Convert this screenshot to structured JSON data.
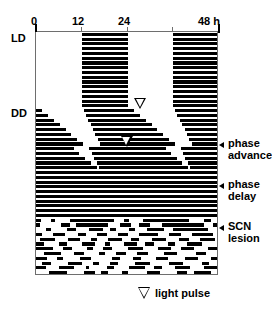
{
  "figure": {
    "type": "actogram",
    "title": "",
    "background_color": "#ffffff",
    "bar_color": "#000000",
    "axis_color": "#6e6e6e"
  },
  "axis": {
    "unit_label": "48 h",
    "ticks": [
      {
        "value": 0,
        "label": "0"
      },
      {
        "value": 12,
        "label": "12"
      },
      {
        "value": 24,
        "label": "24"
      },
      {
        "value": 36,
        "label": ""
      },
      {
        "value": 48,
        "label": "48 h"
      }
    ],
    "range": [
      0,
      48
    ]
  },
  "side_labels": [
    {
      "name": "ld",
      "label": "LD"
    },
    {
      "name": "dd",
      "label": "DD"
    }
  ],
  "annotations": [
    {
      "name": "phase-advance",
      "line1": "phase",
      "line2": "advance"
    },
    {
      "name": "phase-delay",
      "line1": "phase",
      "line2": "delay"
    },
    {
      "name": "scn-lesion",
      "line1": "SCN",
      "line2": "lesion"
    }
  ],
  "legend": {
    "symbol": "light-pulse-triangle",
    "label": "light pulse"
  },
  "light_pulses": [
    {
      "name": "light-pulse-advance",
      "hour": 27.6,
      "day": 17
    },
    {
      "name": "light-pulse-delay",
      "hour": 24.0,
      "day": 25
    }
  ],
  "chart_data": {
    "type": "bar",
    "xlabel": "Time (h)",
    "ylabel": "Successive days",
    "xlim": [
      0,
      48
    ],
    "grid": false,
    "legend_position": "bottom",
    "phases": [
      {
        "name": "LD",
        "days": [
          1,
          16
        ],
        "note": "entrained to light-dark cycle"
      },
      {
        "name": "DD",
        "days": [
          17,
          39
        ],
        "note": "constant darkness, free-running"
      },
      {
        "name": "SCN lesion",
        "days": [
          40,
          51
        ],
        "note": "arrhythmic"
      }
    ],
    "rows": [
      {
        "day": 1,
        "bars": [
          [
            12.0,
            24.0
          ],
          [
            36.0,
            48.0
          ]
        ]
      },
      {
        "day": 2,
        "bars": [
          [
            12.0,
            24.0
          ],
          [
            36.0,
            48.0
          ]
        ]
      },
      {
        "day": 3,
        "bars": [
          [
            12.0,
            24.0
          ],
          [
            36.0,
            48.0
          ]
        ]
      },
      {
        "day": 4,
        "bars": [
          [
            12.0,
            24.0
          ],
          [
            36.0,
            48.0
          ]
        ]
      },
      {
        "day": 5,
        "bars": [
          [
            12.0,
            24.0
          ],
          [
            36.0,
            48.0
          ]
        ]
      },
      {
        "day": 6,
        "bars": [
          [
            12.0,
            24.0
          ],
          [
            36.0,
            48.0
          ]
        ]
      },
      {
        "day": 7,
        "bars": [
          [
            12.0,
            24.0
          ],
          [
            36.0,
            48.0
          ]
        ]
      },
      {
        "day": 8,
        "bars": [
          [
            12.0,
            24.0
          ],
          [
            36.0,
            48.0
          ]
        ]
      },
      {
        "day": 9,
        "bars": [
          [
            12.0,
            24.0
          ],
          [
            36.0,
            48.0
          ]
        ]
      },
      {
        "day": 10,
        "bars": [
          [
            12.0,
            24.0
          ],
          [
            36.0,
            48.0
          ]
        ]
      },
      {
        "day": 11,
        "bars": [
          [
            12.0,
            24.0
          ],
          [
            36.0,
            48.0
          ]
        ]
      },
      {
        "day": 12,
        "bars": [
          [
            12.0,
            24.0
          ],
          [
            36.0,
            48.0
          ]
        ]
      },
      {
        "day": 13,
        "bars": [
          [
            12.0,
            24.0
          ],
          [
            36.0,
            48.0
          ]
        ]
      },
      {
        "day": 14,
        "bars": [
          [
            12.0,
            24.0
          ],
          [
            36.0,
            48.0
          ]
        ]
      },
      {
        "day": 15,
        "bars": [
          [
            12.0,
            24.0
          ],
          [
            36.0,
            48.0
          ]
        ]
      },
      {
        "day": 16,
        "bars": [
          [
            12.0,
            24.0
          ],
          [
            36.0,
            48.0
          ]
        ]
      },
      {
        "day": 17,
        "bars": [
          [
            0.0,
            1.6
          ],
          [
            12.5,
            25.6
          ],
          [
            36.5,
            48.0
          ]
        ]
      },
      {
        "day": 18,
        "bars": [
          [
            0.0,
            3.2
          ],
          [
            13.0,
            27.2
          ],
          [
            37.0,
            48.0
          ]
        ]
      },
      {
        "day": 19,
        "bars": [
          [
            0.0,
            4.8
          ],
          [
            13.7,
            28.8
          ],
          [
            37.7,
            48.0
          ]
        ]
      },
      {
        "day": 20,
        "bars": [
          [
            0.0,
            6.3
          ],
          [
            14.3,
            30.3
          ],
          [
            38.3,
            48.0
          ]
        ]
      },
      {
        "day": 21,
        "bars": [
          [
            0.0,
            7.8
          ],
          [
            15.0,
            31.8
          ],
          [
            39.0,
            48.0
          ]
        ]
      },
      {
        "day": 22,
        "bars": [
          [
            0.0,
            9.3
          ],
          [
            15.6,
            33.3
          ],
          [
            39.6,
            48.0
          ]
        ]
      },
      {
        "day": 23,
        "bars": [
          [
            0.0,
            10.8
          ],
          [
            16.2,
            34.8
          ],
          [
            40.2,
            48.0
          ]
        ]
      },
      {
        "day": 24,
        "bars": [
          [
            0.0,
            12.4
          ],
          [
            16.9,
            36.4
          ],
          [
            40.9,
            48.0
          ]
        ]
      },
      {
        "day": 25,
        "bars": [
          [
            0.0,
            10.0
          ],
          [
            14.0,
            34.0
          ],
          [
            38.0,
            48.0
          ]
        ]
      },
      {
        "day": 26,
        "bars": [
          [
            0.0,
            11.4
          ],
          [
            14.6,
            35.4
          ],
          [
            38.6,
            48.0
          ]
        ]
      },
      {
        "day": 27,
        "bars": [
          [
            0.0,
            12.9
          ],
          [
            15.2,
            36.9
          ],
          [
            39.2,
            48.0
          ]
        ]
      },
      {
        "day": 28,
        "bars": [
          [
            0.0,
            14.4
          ],
          [
            15.9,
            38.4
          ],
          [
            39.9,
            48.0
          ]
        ]
      },
      {
        "day": 29,
        "bars": [
          [
            0.0,
            15.9
          ],
          [
            16.5,
            39.9
          ],
          [
            40.5,
            48.0
          ]
        ]
      },
      {
        "day": 30,
        "bars": [
          [
            0.0,
            17.4
          ],
          [
            17.2,
            41.4
          ],
          [
            41.2,
            48.0
          ]
        ]
      },
      {
        "day": 31,
        "bars": [
          [
            0.0,
            19.0
          ],
          [
            17.8,
            43.0
          ],
          [
            41.8,
            48.0
          ]
        ]
      },
      {
        "day": 32,
        "bars": [
          [
            0.0,
            20.5
          ],
          [
            18.4,
            44.5
          ],
          [
            42.4,
            48.0
          ]
        ]
      },
      {
        "day": 33,
        "bars": [
          [
            0.0,
            22.0
          ],
          [
            19.1,
            46.0
          ],
          [
            43.1,
            48.0
          ]
        ]
      },
      {
        "day": 34,
        "bars": [
          [
            0.0,
            23.5
          ],
          [
            19.7,
            47.5
          ]
        ]
      },
      {
        "day": 35,
        "bars": [
          [
            0.0,
            25.0
          ],
          [
            20.4,
            48.0
          ]
        ]
      },
      {
        "day": 36,
        "bars": [
          [
            0.0,
            26.6
          ],
          [
            21.0,
            48.0
          ]
        ]
      },
      {
        "day": 37,
        "bars": [
          [
            0.0,
            28.1
          ],
          [
            21.6,
            48.0
          ]
        ]
      },
      {
        "day": 38,
        "bars": [
          [
            0.0,
            29.6
          ],
          [
            22.3,
            48.0
          ]
        ]
      },
      {
        "day": 39,
        "bars": [
          [
            0.0,
            31.1
          ],
          [
            22.9,
            48.0
          ]
        ]
      },
      {
        "day": 40,
        "bars": [
          [
            0.0,
            1.2
          ],
          [
            4.0,
            5.0
          ],
          [
            9.0,
            20.5
          ],
          [
            23.0,
            24.5
          ],
          [
            28.0,
            40.0
          ],
          [
            44.0,
            46.0
          ]
        ]
      },
      {
        "day": 41,
        "bars": [
          [
            0.0,
            1.0
          ],
          [
            6.5,
            9.0
          ],
          [
            10.5,
            19.0
          ],
          [
            22.0,
            25.0
          ],
          [
            27.0,
            30.0
          ],
          [
            33.0,
            44.0
          ],
          [
            46.5,
            48.0
          ]
        ]
      },
      {
        "day": 42,
        "bars": [
          [
            2.5,
            4.0
          ],
          [
            8.0,
            10.5
          ],
          [
            14.0,
            17.5
          ],
          [
            19.5,
            21.0
          ],
          [
            24.5,
            26.0
          ],
          [
            29.0,
            33.5
          ],
          [
            36.0,
            45.0
          ]
        ]
      },
      {
        "day": 43,
        "bars": [
          [
            0.0,
            1.5
          ],
          [
            4.5,
            7.5
          ],
          [
            11.0,
            13.0
          ],
          [
            16.0,
            18.5
          ],
          [
            21.5,
            24.0
          ],
          [
            27.0,
            32.0
          ],
          [
            35.0,
            38.0
          ],
          [
            41.0,
            46.5
          ]
        ]
      },
      {
        "day": 44,
        "bars": [
          [
            1.0,
            5.0
          ],
          [
            8.5,
            11.5
          ],
          [
            14.5,
            16.0
          ],
          [
            19.0,
            22.5
          ],
          [
            25.0,
            27.0
          ],
          [
            30.5,
            34.0
          ],
          [
            37.5,
            40.0
          ],
          [
            43.0,
            47.0
          ]
        ]
      },
      {
        "day": 45,
        "bars": [
          [
            0.0,
            2.0
          ],
          [
            6.0,
            8.0
          ],
          [
            12.0,
            15.5
          ],
          [
            18.0,
            19.5
          ],
          [
            23.0,
            26.5
          ],
          [
            28.5,
            31.0
          ],
          [
            34.5,
            36.5
          ],
          [
            39.5,
            43.5
          ]
        ]
      },
      {
        "day": 46,
        "bars": [
          [
            0.0,
            4.5
          ],
          [
            7.0,
            9.5
          ],
          [
            13.5,
            15.0
          ],
          [
            17.5,
            20.0
          ],
          [
            24.0,
            28.0
          ],
          [
            32.0,
            35.5
          ],
          [
            38.0,
            41.5
          ],
          [
            45.0,
            48.0
          ]
        ]
      },
      {
        "day": 47,
        "bars": [
          [
            2.0,
            6.5
          ],
          [
            10.0,
            12.5
          ],
          [
            16.5,
            18.0
          ],
          [
            21.0,
            23.5
          ],
          [
            26.5,
            29.5
          ],
          [
            33.5,
            37.0
          ],
          [
            42.0,
            44.5
          ]
        ]
      },
      {
        "day": 48,
        "bars": [
          [
            0.0,
            3.0
          ],
          [
            5.5,
            7.0
          ],
          [
            11.5,
            14.5
          ],
          [
            20.0,
            22.0
          ],
          [
            25.5,
            27.5
          ],
          [
            31.5,
            34.5
          ],
          [
            39.0,
            42.5
          ],
          [
            46.0,
            48.0
          ]
        ]
      },
      {
        "day": 49,
        "bars": [
          [
            1.5,
            4.0
          ],
          [
            8.5,
            12.0
          ],
          [
            15.0,
            16.5
          ],
          [
            19.5,
            21.5
          ],
          [
            26.0,
            30.0
          ],
          [
            35.0,
            38.5
          ],
          [
            43.5,
            45.5
          ]
        ]
      },
      {
        "day": 50,
        "bars": [
          [
            0.0,
            2.5
          ],
          [
            6.0,
            10.0
          ],
          [
            13.0,
            14.0
          ],
          [
            18.5,
            20.5
          ],
          [
            24.5,
            28.5
          ],
          [
            31.0,
            33.0
          ],
          [
            36.5,
            40.5
          ],
          [
            44.0,
            47.5
          ]
        ]
      },
      {
        "day": 51,
        "bars": [
          [
            3.5,
            8.0
          ],
          [
            12.5,
            15.5
          ],
          [
            17.0,
            19.0
          ],
          [
            22.5,
            24.0
          ],
          [
            29.0,
            32.5
          ],
          [
            37.0,
            39.5
          ],
          [
            41.5,
            46.0
          ]
        ]
      }
    ]
  }
}
